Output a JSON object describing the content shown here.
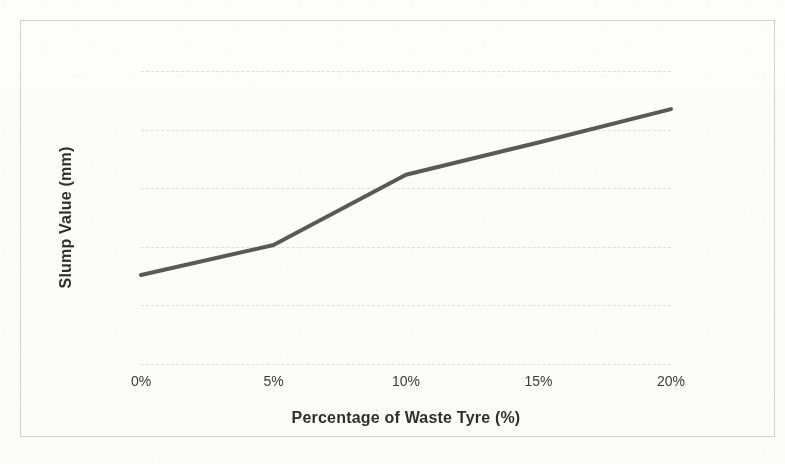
{
  "chart_data": {
    "type": "line",
    "title": "",
    "subtitle": "",
    "xlabel": "Percentage of Waste Tyre (%)",
    "ylabel": "Slump Value (mm)",
    "categories": [
      "0%",
      "5%",
      "10%",
      "15%",
      "20%"
    ],
    "x_values": [
      0,
      5,
      10,
      15,
      20
    ],
    "values": [
      65.2,
      70.3,
      82.3,
      87.8,
      93.5
    ],
    "series": [
      {
        "name": "Slump Value",
        "values": [
          65.2,
          70.3,
          82.3,
          87.8,
          93.5
        ]
      }
    ],
    "ylim": [
      50,
      100
    ],
    "xlim": [
      0,
      20
    ],
    "y_ticks": [
      50,
      60,
      70,
      80,
      90,
      100
    ],
    "y_tick_labels": [
      "50",
      "60",
      "70",
      "80",
      "90",
      "100"
    ],
    "x_tick_labels": [
      "0%",
      "5%",
      "10%",
      "15%",
      "20%"
    ],
    "grid": "horizontal-dashed",
    "legend": "none",
    "line_color": "#595959",
    "line_width": 4,
    "markers": "none",
    "plot_border": "#d2d2d0",
    "background_color": "#ffffff"
  },
  "axes": {
    "y_title": "Slump Value (mm)",
    "x_title": "Percentage of Waste Tyre (%)",
    "y_labels": [
      "100",
      "90",
      "80",
      "70",
      "60",
      "50"
    ],
    "x_labels": [
      "0%",
      "5%",
      "10%",
      "15%",
      "20%"
    ]
  }
}
